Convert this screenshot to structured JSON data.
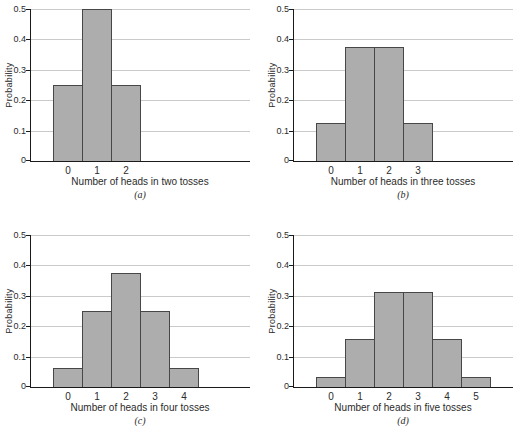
{
  "figure": {
    "background": "#ffffff"
  },
  "colors": {
    "bar_fill": "#adadad",
    "bar_border": "#474747",
    "grid": "#cacaca",
    "axis": "#1a1a1a",
    "text": "#2b2b2b"
  },
  "chart_data": [
    {
      "type": "bar",
      "caption": "(a)",
      "xlabel": "Number of heads in two tosses",
      "ylabel": "Probability",
      "categories": [
        "0",
        "1",
        "2"
      ],
      "values": [
        0.25,
        0.5,
        0.25
      ],
      "yticks": [
        "0",
        "0.1",
        "0.2",
        "0.3",
        "0.4",
        "0.5"
      ],
      "ylim": [
        0,
        0.5
      ],
      "grid": true,
      "legend": "none"
    },
    {
      "type": "bar",
      "caption": "(b)",
      "xlabel": "Number of heads in three tosses",
      "ylabel": "Probability",
      "categories": [
        "0",
        "1",
        "2",
        "3"
      ],
      "values": [
        0.125,
        0.375,
        0.375,
        0.125
      ],
      "yticks": [
        "0",
        "0.1",
        "0.2",
        "0.3",
        "0.4",
        "0.5"
      ],
      "ylim": [
        0,
        0.5
      ],
      "grid": true,
      "legend": "none"
    },
    {
      "type": "bar",
      "caption": "(c)",
      "xlabel": "Number of heads in four tosses",
      "ylabel": "Probability",
      "categories": [
        "0",
        "1",
        "2",
        "3",
        "4"
      ],
      "values": [
        0.0625,
        0.25,
        0.375,
        0.25,
        0.0625
      ],
      "yticks": [
        "0",
        "0.1",
        "0.2",
        "0.3",
        "0.4",
        "0.5"
      ],
      "ylim": [
        0,
        0.5
      ],
      "grid": true,
      "legend": "none"
    },
    {
      "type": "bar",
      "caption": "(d)",
      "xlabel": "Number of heads in five tosses",
      "ylabel": "Probability",
      "categories": [
        "0",
        "1",
        "2",
        "3",
        "4",
        "5"
      ],
      "values": [
        0.03125,
        0.15625,
        0.3125,
        0.3125,
        0.15625,
        0.03125
      ],
      "yticks": [
        "0",
        "0.1",
        "0.2",
        "0.3",
        "0.4",
        "0.5"
      ],
      "ylim": [
        0,
        0.5
      ],
      "grid": true,
      "legend": "none"
    }
  ]
}
